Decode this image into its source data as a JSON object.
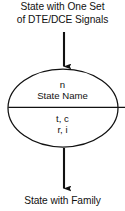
{
  "figure": {
    "type": "state-diagram",
    "background_color": "#ffffff",
    "stroke_color": "#111111"
  },
  "captions": {
    "top_line_1": "State with One Set",
    "top_line_2": "of DTE/DCE Signals",
    "bottom": "State with Family"
  },
  "state_node": {
    "shape": "ellipse",
    "upper_compartment": {
      "index": "n",
      "name": "State Name"
    },
    "lower_compartment": {
      "signals_line_1": "t, c",
      "signals_line_2": "r, i"
    }
  },
  "arrows": {
    "incoming": "down-arrow",
    "outgoing": "down-arrow"
  }
}
